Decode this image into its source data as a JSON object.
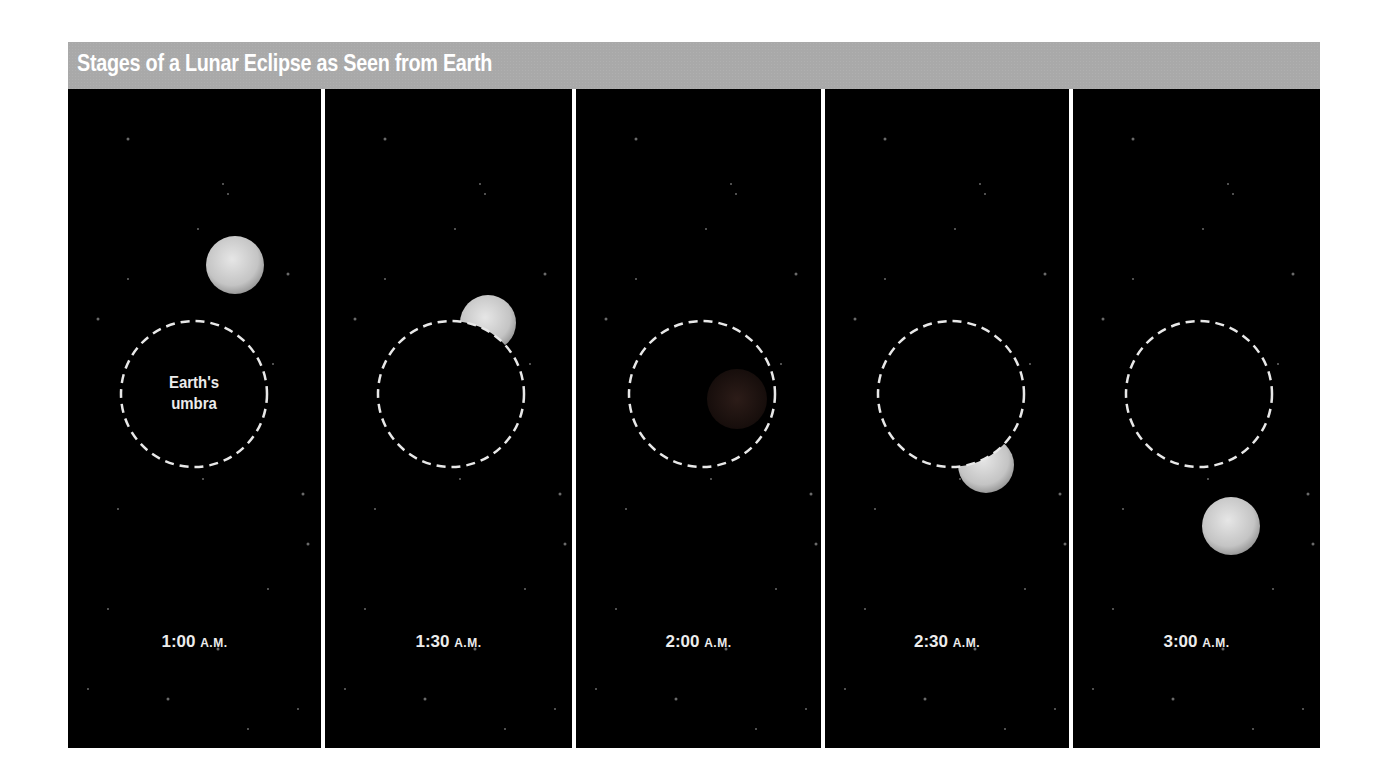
{
  "title": "Stages of a Lunar Eclipse as Seen from Earth",
  "umbra_label": [
    "Earth's",
    "umbra"
  ],
  "colors": {
    "header_bg": "#a9a9a9",
    "panel_bg": "#000000",
    "divider": "#ffffff",
    "umbra_outline": "#e8e8e8",
    "moon_light": "#e6e6e6",
    "moon_dark": "#9a9a9a",
    "eclipsed_moon": "#2a1a16"
  },
  "stages": [
    {
      "time": "1:00",
      "ampm": "A.M.",
      "moon_state": "outside umbra, above-right",
      "show_label": true
    },
    {
      "time": "1:30",
      "ampm": "A.M.",
      "moon_state": "partially entering umbra (upper right)",
      "show_label": false
    },
    {
      "time": "2:00",
      "ampm": "A.M.",
      "moon_state": "total eclipse, inside umbra",
      "show_label": false
    },
    {
      "time": "2:30",
      "ampm": "A.M.",
      "moon_state": "partially leaving umbra (lower right)",
      "show_label": false
    },
    {
      "time": "3:00",
      "ampm": "A.M.",
      "moon_state": "outside umbra, below-right",
      "show_label": false
    }
  ]
}
